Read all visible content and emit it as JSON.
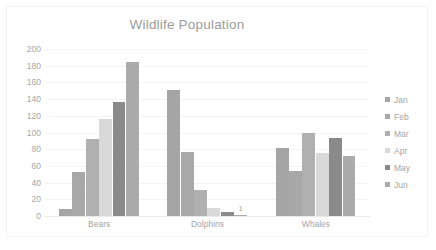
{
  "chart_data": {
    "type": "bar",
    "title": "Wildlife Population",
    "xlabel": "",
    "ylabel": "",
    "categories": [
      "Bears",
      "Dolphins",
      "Whales"
    ],
    "series": [
      {
        "name": "Jan",
        "values": [
          8,
          151,
          81
        ],
        "color": "#a5a5a5"
      },
      {
        "name": "Feb",
        "values": [
          53,
          77,
          54
        ],
        "color": "#a8a8a8"
      },
      {
        "name": "Mar",
        "values": [
          92,
          31,
          100
        ],
        "color": "#b0b0b0"
      },
      {
        "name": "Apr",
        "values": [
          116,
          10,
          76
        ],
        "color": "#d9d9d9"
      },
      {
        "name": "May",
        "values": [
          137,
          5,
          93
        ],
        "color": "#8a8a8a"
      },
      {
        "name": "Jun",
        "values": [
          184,
          1,
          72
        ],
        "color": "#ababab"
      }
    ],
    "ylim": [
      0,
      200
    ],
    "yticks": [
      0,
      20,
      40,
      60,
      80,
      100,
      120,
      140,
      160,
      180,
      200
    ],
    "ytick_labels": [
      "0",
      "20",
      "40",
      "60",
      "80",
      "100",
      "120",
      "140",
      "160",
      "180",
      "200"
    ],
    "grid": true,
    "legend_position": "right",
    "legend_entries": [
      "Jan",
      "Feb",
      "Mar",
      "Apr",
      "May",
      "Jun"
    ],
    "data_labels": [
      {
        "category": "Dolphins",
        "series": "Jun",
        "text": "1"
      }
    ]
  },
  "colors": {
    "title_text": "#9b9b9b",
    "axis_text": "#a6a6a6",
    "gridline": "#f4f4f4",
    "plot_background": "#ffffff",
    "frame_border": "#f2f2f2"
  }
}
